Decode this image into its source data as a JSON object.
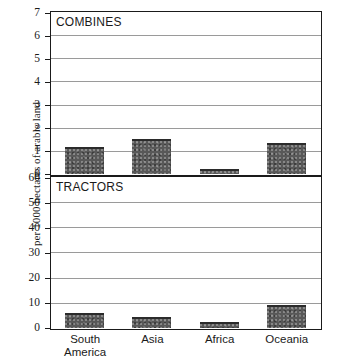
{
  "chart_data": {
    "type": "bar",
    "title": "",
    "ylabel": "per 1000 hectares of arable land",
    "xlabel": "",
    "grid": true,
    "legend": "none",
    "categories": [
      "South America",
      "Asia",
      "Africa",
      "Oceania"
    ],
    "category_lines": [
      [
        "South",
        "America"
      ],
      [
        "Asia",
        ""
      ],
      [
        "Africa",
        ""
      ],
      [
        "Oceania",
        ""
      ]
    ],
    "panels": [
      {
        "name": "COMBINES",
        "ylim": [
          0,
          7
        ],
        "yticks": [
          0,
          1,
          2,
          3,
          4,
          5,
          6,
          7
        ],
        "ytick_labels": [
          "0",
          "1",
          "2",
          "3",
          "4",
          "5",
          "6",
          "7"
        ],
        "values": [
          1.15,
          1.5,
          0.2,
          1.35
        ]
      },
      {
        "name": "TRACTORS",
        "ylim": [
          0,
          60
        ],
        "yticks": [
          0,
          10,
          20,
          30,
          40,
          50,
          60
        ],
        "ytick_labels": [
          "0",
          "10",
          "20",
          "30",
          "40",
          "50",
          "60"
        ],
        "values": [
          6,
          4.5,
          2.5,
          9
        ]
      }
    ],
    "colors": {
      "bar_fill": "#585858",
      "bar_edge": "#2b2b2b",
      "axis": "#1a1a1a",
      "gridline": "#9a9a9a",
      "background": "#ffffff"
    }
  }
}
